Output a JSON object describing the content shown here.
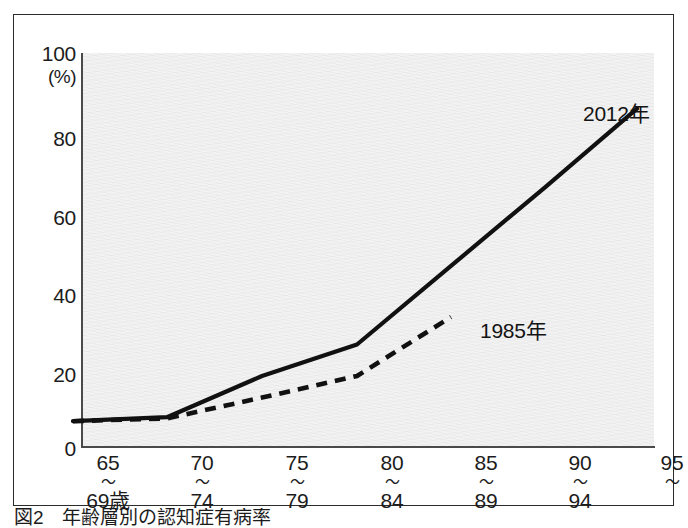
{
  "caption": {
    "number": "図2",
    "title": "年齢層別の認知症有病率",
    "source": ""
  },
  "axes": {
    "y_unit": "(%)",
    "y_ticks": [
      "0",
      "20",
      "40",
      "60",
      "80",
      "100"
    ],
    "x_bands": [
      {
        "from": "65",
        "tilde": "〜",
        "to": "69歳"
      },
      {
        "from": "70",
        "tilde": "〜",
        "to": "74"
      },
      {
        "from": "75",
        "tilde": "〜",
        "to": "79"
      },
      {
        "from": "80",
        "tilde": "〜",
        "to": "84"
      },
      {
        "from": "85",
        "tilde": "〜",
        "to": "89"
      },
      {
        "from": "90",
        "tilde": "〜",
        "to": "94"
      },
      {
        "from": "95",
        "tilde": "〜",
        "to": ""
      }
    ]
  },
  "labels": {
    "series_2012": "2012年",
    "series_1985": "1985年"
  },
  "chart_data": {
    "type": "line",
    "title": "年齢層別の認知症有病率",
    "xlabel": "",
    "ylabel": "(%)",
    "ylim": [
      0,
      100
    ],
    "grid": false,
    "legend": "in-plot annotations",
    "categories": [
      "65〜69歳",
      "70〜74",
      "75〜79",
      "80〜84",
      "85〜89",
      "90〜94",
      "95〜"
    ],
    "series": [
      {
        "name": "2012年",
        "style": "solid",
        "color": "#111111",
        "values": [
          2.5,
          3.5,
          14.0,
          22.0,
          42.0,
          62.0,
          82.0
        ]
      },
      {
        "name": "1985年",
        "style": "dashed",
        "color": "#111111",
        "values": [
          2.5,
          3.2,
          8.5,
          14.0,
          29.0,
          null,
          null
        ]
      }
    ]
  },
  "geometry": {
    "plot_left": 68,
    "plot_top": 38,
    "plot_width": 572,
    "plot_height": 393,
    "tick_x": [
      73,
      167,
      262,
      357,
      451,
      545,
      637
    ]
  },
  "colors": {
    "line": "#111111",
    "frame": "#2b2b2b",
    "plot_bg": "#f2f2f2",
    "text": "#1c1c1c"
  }
}
